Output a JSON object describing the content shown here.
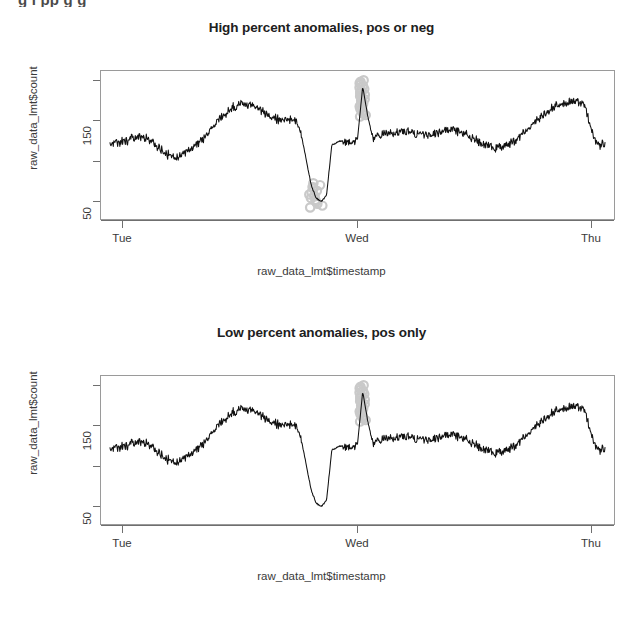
{
  "page": {
    "clipped_top_text": "g    i    pp g g",
    "background": "#ffffff",
    "series_color": "#111111",
    "anomaly_color": "#c9c9c9"
  },
  "panels": [
    {
      "id": "high-percent",
      "title": "High percent anomalies, pos or neg",
      "ylabel": "raw_data_lmt$count",
      "xlabel": "raw_data_lmt$timestamp",
      "ytick_labels": [
        "150",
        "50"
      ],
      "xtick_labels": [
        "Tue",
        "Wed",
        "Thu"
      ]
    },
    {
      "id": "low-percent",
      "title": "Low percent anomalies, pos only",
      "ylabel": "raw_data_lmt$count",
      "xlabel": "raw_data_lmt$timestamp",
      "ytick_labels": [
        "150",
        "50"
      ],
      "xtick_labels": [
        "Tue",
        "Wed",
        "Thu"
      ]
    }
  ],
  "chart_data": [
    {
      "type": "line",
      "title": "High percent anomalies, pos or neg",
      "xlabel": "raw_data_lmt$timestamp",
      "ylabel": "raw_data_lmt$count",
      "xlim": [
        0,
        48
      ],
      "ylim": [
        20,
        205
      ],
      "yticks": [
        50,
        100,
        150,
        200
      ],
      "ytick_labels": [
        "50",
        "",
        "150",
        ""
      ],
      "xticks": [
        1.5,
        25.5,
        49.5
      ],
      "xtick_labels": [
        "Tue",
        "Wed",
        "Thu"
      ],
      "grid": false,
      "legend": null,
      "series": [
        {
          "name": "count",
          "noise_amplitude": 9,
          "x": [
            0,
            0.5,
            1,
            1.5,
            2,
            2.5,
            3,
            3.5,
            4,
            4.5,
            5,
            5.5,
            6,
            6.5,
            7,
            7.5,
            8,
            8.5,
            9,
            9.5,
            10,
            10.5,
            11,
            11.5,
            12,
            12.5,
            13,
            13.5,
            14,
            14.5,
            15,
            15.5,
            16,
            16.5,
            17,
            17.5,
            18,
            18.5,
            19,
            19.5,
            20,
            20.5,
            21,
            21.5,
            22,
            22.5,
            23,
            23.5,
            24,
            24.5,
            25,
            25.5,
            26,
            26.5,
            27,
            27.5,
            28,
            28.5,
            29,
            29.5,
            30,
            30.5,
            31,
            31.5,
            32,
            32.5,
            33,
            33.5,
            34,
            34.5,
            35,
            35.5,
            36,
            36.5,
            37,
            37.5,
            38,
            38.5,
            39,
            39.5,
            40,
            40.5,
            41,
            41.5,
            42,
            42.5,
            43,
            43.5,
            44,
            44.5,
            45,
            45.5,
            46,
            46.5,
            47,
            47.5,
            48
          ],
          "y": [
            112,
            114,
            116,
            118,
            120,
            122,
            124,
            122,
            118,
            112,
            106,
            101,
            98,
            97,
            99,
            103,
            108,
            114,
            121,
            129,
            137,
            145,
            152,
            158,
            163,
            166,
            167,
            166,
            163,
            159,
            155,
            151,
            148,
            146,
            145,
            146,
            143,
            130,
            95,
            60,
            42,
            38,
            46,
            112,
            116,
            118,
            117,
            115,
            120,
            190,
            150,
            120,
            124,
            126,
            128,
            129,
            130,
            130,
            129,
            128,
            127,
            126,
            126,
            127,
            129,
            131,
            132,
            132,
            130,
            127,
            123,
            119,
            115,
            112,
            110,
            109,
            110,
            112,
            116,
            121,
            127,
            133,
            140,
            147,
            153,
            158,
            162,
            165,
            168,
            170,
            171,
            170,
            167,
            140,
            118,
            112,
            116
          ]
        }
      ],
      "anomalies": {
        "positive": {
          "count": 26,
          "x_range": [
            24.2,
            24.8
          ],
          "y_range": [
            150,
            198
          ],
          "marker": "circle",
          "color": "#c9c9c9"
        },
        "negative": {
          "count": 14,
          "x_range": [
            19.3,
            20.6
          ],
          "y_range": [
            30,
            62
          ],
          "marker": "circle",
          "color": "#c9c9c9"
        }
      }
    },
    {
      "type": "line",
      "title": "Low percent anomalies, pos only",
      "xlabel": "raw_data_lmt$timestamp",
      "ylabel": "raw_data_lmt$count",
      "xlim": [
        0,
        48
      ],
      "ylim": [
        20,
        205
      ],
      "yticks": [
        50,
        100,
        150,
        200
      ],
      "ytick_labels": [
        "50",
        "",
        "150",
        ""
      ],
      "xticks": [
        1.5,
        25.5,
        49.5
      ],
      "xtick_labels": [
        "Tue",
        "Wed",
        "Thu"
      ],
      "grid": false,
      "legend": null,
      "series": [
        {
          "name": "count",
          "noise_amplitude": 9,
          "x": [
            0,
            0.5,
            1,
            1.5,
            2,
            2.5,
            3,
            3.5,
            4,
            4.5,
            5,
            5.5,
            6,
            6.5,
            7,
            7.5,
            8,
            8.5,
            9,
            9.5,
            10,
            10.5,
            11,
            11.5,
            12,
            12.5,
            13,
            13.5,
            14,
            14.5,
            15,
            15.5,
            16,
            16.5,
            17,
            17.5,
            18,
            18.5,
            19,
            19.5,
            20,
            20.5,
            21,
            21.5,
            22,
            22.5,
            23,
            23.5,
            24,
            24.5,
            25,
            25.5,
            26,
            26.5,
            27,
            27.5,
            28,
            28.5,
            29,
            29.5,
            30,
            30.5,
            31,
            31.5,
            32,
            32.5,
            33,
            33.5,
            34,
            34.5,
            35,
            35.5,
            36,
            36.5,
            37,
            37.5,
            38,
            38.5,
            39,
            39.5,
            40,
            40.5,
            41,
            41.5,
            42,
            42.5,
            43,
            43.5,
            44,
            44.5,
            45,
            45.5,
            46,
            46.5,
            47,
            47.5,
            48
          ],
          "y": [
            112,
            114,
            116,
            118,
            120,
            122,
            124,
            122,
            118,
            112,
            106,
            101,
            98,
            97,
            99,
            103,
            108,
            114,
            121,
            129,
            137,
            145,
            152,
            158,
            163,
            166,
            167,
            166,
            163,
            159,
            155,
            151,
            148,
            146,
            145,
            146,
            143,
            130,
            95,
            60,
            42,
            38,
            46,
            112,
            116,
            118,
            117,
            115,
            120,
            190,
            150,
            120,
            124,
            126,
            128,
            129,
            130,
            130,
            129,
            128,
            127,
            126,
            126,
            127,
            129,
            131,
            132,
            132,
            130,
            127,
            123,
            119,
            115,
            112,
            110,
            109,
            110,
            112,
            116,
            121,
            127,
            133,
            140,
            147,
            153,
            158,
            162,
            165,
            168,
            170,
            171,
            170,
            167,
            140,
            118,
            112,
            116
          ]
        }
      ],
      "anomalies": {
        "positive": {
          "count": 26,
          "x_range": [
            24.2,
            24.8
          ],
          "y_range": [
            150,
            198
          ],
          "marker": "circle",
          "color": "#c9c9c9"
        },
        "negative": {
          "count": 0,
          "x_range": [
            0,
            0
          ],
          "y_range": [
            0,
            0
          ],
          "marker": "circle",
          "color": "#c9c9c9"
        }
      }
    }
  ]
}
